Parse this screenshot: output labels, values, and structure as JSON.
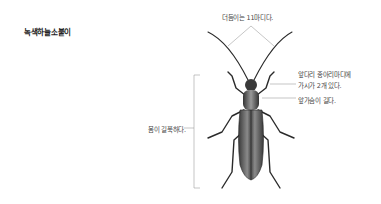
{
  "title": "녹색하늘소붙이",
  "labels": {
    "antenna": "더듬이는 11마디다.",
    "front_leg_line1": "앞다리 종아리마디에",
    "front_leg_line2": "가시가 2개 있다.",
    "pronotum": "앞가슴이 길다.",
    "body": "몸이 길쭉하다."
  },
  "colors": {
    "line": "#9a9a9a",
    "beetle_dark": "#2a2a2a",
    "beetle_mid": "#6a6a6a",
    "text": "#444444"
  }
}
